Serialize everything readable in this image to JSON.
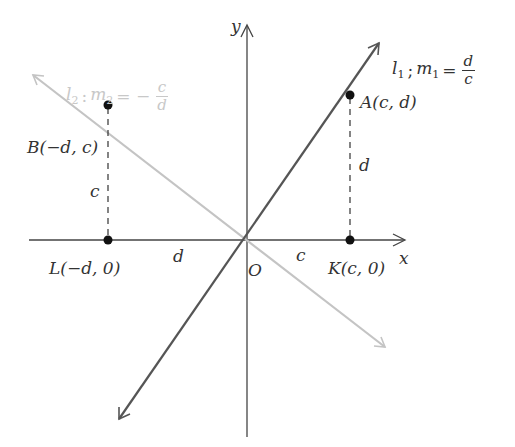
{
  "colors": {
    "axis": "#444444",
    "line_l1": "#555555",
    "line_l2": "#c4c4c4",
    "point": "#111111",
    "dashed": "#333333",
    "label": "#333333",
    "label_light": "#c8c8c8"
  },
  "axes": {
    "x_label": "x",
    "y_label": "y",
    "origin_label": "O"
  },
  "lines": {
    "l1": {
      "name": "l",
      "sub": "1",
      "slope_name": "m",
      "slope_sub": "1",
      "eq": "=",
      "num": "d",
      "den": "c",
      "sep": ";"
    },
    "l2": {
      "name": "l",
      "sub": "2",
      "slope_name": "m",
      "slope_sub": "2",
      "eq": "= −",
      "num": "c",
      "den": "d",
      "sep": ":"
    }
  },
  "points": {
    "A": {
      "label": "A(c, d)"
    },
    "B": {
      "label": "B(−d, c)"
    },
    "K": {
      "label": "K(c, 0)"
    },
    "L": {
      "label": "L(−d, 0)"
    }
  },
  "segment_labels": {
    "A_height": "d",
    "B_height": "c",
    "OL_length": "d",
    "OK_length": "c"
  }
}
